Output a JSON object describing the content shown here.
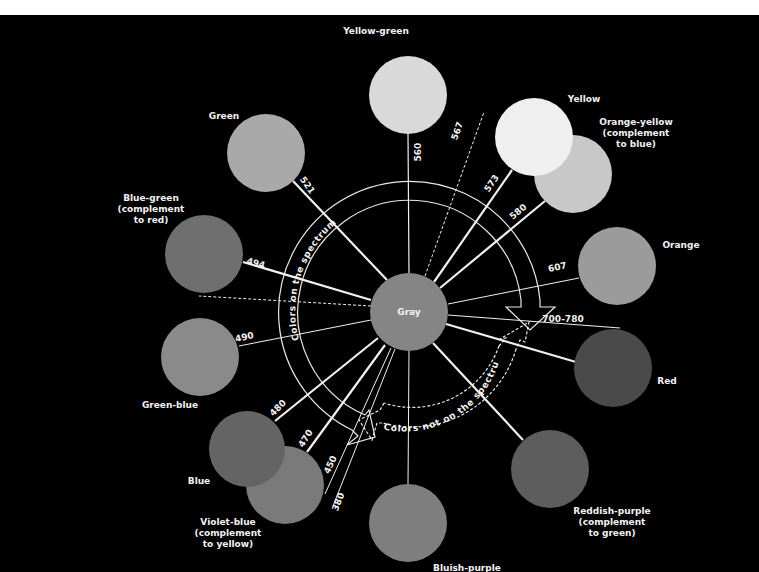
{
  "diagram": {
    "title": "",
    "background": "#000000",
    "line_color": "#f0f0f0",
    "center": {
      "name": "Gray",
      "label": "Gray",
      "x": 409,
      "y": 312,
      "r": 39,
      "color": "#858585"
    },
    "arcs": {
      "on_spectrum_label": "Colors on the spectrum",
      "not_on_spectrum_label": "Colors not on the spectrum"
    },
    "colors": [
      {
        "name": "Yellow-green",
        "label_lines": [
          "Yellow-green"
        ],
        "x": 408,
        "y": 95,
        "r": 39,
        "color": "#d9d9d9",
        "label_x": 376,
        "label_y": 34,
        "anchor": "middle"
      },
      {
        "name": "Yellow",
        "label_lines": [
          "Yellow"
        ],
        "x": 534,
        "y": 137,
        "r": 39,
        "color": "#efefef",
        "label_x": 584,
        "label_y": 102,
        "anchor": "middle"
      },
      {
        "name": "Orange-yellow",
        "label_lines": [
          "Orange-yellow",
          "(complement",
          "to blue)"
        ],
        "x": 573,
        "y": 174,
        "r": 39,
        "color": "#c8c8c8",
        "label_x": 636,
        "label_y": 125,
        "anchor": "middle"
      },
      {
        "name": "Green",
        "label_lines": [
          "Green"
        ],
        "x": 266,
        "y": 153,
        "r": 39,
        "color": "#a9a9a9",
        "label_x": 224,
        "label_y": 119,
        "anchor": "middle"
      },
      {
        "name": "Blue-green",
        "label_lines": [
          "Blue-green",
          "(complement",
          "to red)"
        ],
        "x": 204,
        "y": 254,
        "r": 39,
        "color": "#6f6f6f",
        "label_x": 151,
        "label_y": 201,
        "anchor": "middle"
      },
      {
        "name": "Orange",
        "label_lines": [
          "Orange"
        ],
        "x": 617,
        "y": 266,
        "r": 39,
        "color": "#9b9b9b",
        "label_x": 681,
        "label_y": 248,
        "anchor": "middle"
      },
      {
        "name": "Green-blue",
        "label_lines": [
          "Green-blue"
        ],
        "x": 200,
        "y": 357,
        "r": 39,
        "color": "#8a8a8a",
        "label_x": 170,
        "label_y": 408,
        "anchor": "middle"
      },
      {
        "name": "Red",
        "label_lines": [
          "Red"
        ],
        "x": 613,
        "y": 368,
        "r": 39,
        "color": "#4a4a4a",
        "label_x": 667,
        "label_y": 384,
        "anchor": "middle"
      },
      {
        "name": "Blue",
        "label_lines": [
          "Blue"
        ],
        "x": 247,
        "y": 449,
        "r": 38,
        "color": "#646464",
        "label_x": 199,
        "label_y": 484,
        "anchor": "middle"
      },
      {
        "name": "Violet-blue",
        "label_lines": [
          "Violet-blue",
          "(complement",
          "to yellow)"
        ],
        "x": 285,
        "y": 485,
        "r": 39,
        "color": "#7a7a7a",
        "label_x": 228,
        "label_y": 525,
        "anchor": "middle"
      },
      {
        "name": "Reddish-purple",
        "label_lines": [
          "Reddish-purple",
          "(complement",
          "to green)"
        ],
        "x": 550,
        "y": 469,
        "r": 39,
        "color": "#5d5d5d",
        "label_x": 612,
        "label_y": 514,
        "anchor": "middle"
      },
      {
        "name": "Bluish-purple",
        "label_lines": [
          "Bluish-purple"
        ],
        "x": 408,
        "y": 523,
        "r": 39,
        "color": "#7e7e7e",
        "label_x": 467,
        "label_y": 571,
        "anchor": "middle"
      }
    ],
    "wavelength_lines": [
      {
        "label": "560",
        "x1": 409,
        "y1": 273,
        "x2": 408,
        "y2": 134,
        "width": 1.2,
        "dash": "",
        "lx": 421,
        "ly": 152,
        "rot": -90
      },
      {
        "label": "567",
        "x1": 425,
        "y1": 276,
        "x2": 484,
        "y2": 112,
        "width": 1,
        "dash": "3,2",
        "lx": 460,
        "ly": 132,
        "rot": -70
      },
      {
        "label": "573",
        "x1": 434,
        "y1": 282,
        "x2": 512,
        "y2": 170,
        "width": 2.2,
        "dash": "",
        "lx": 494,
        "ly": 185,
        "rot": -56
      },
      {
        "label": "580",
        "x1": 440,
        "y1": 288,
        "x2": 545,
        "y2": 201,
        "width": 2.2,
        "dash": "",
        "lx": 520,
        "ly": 214,
        "rot": -40
      },
      {
        "label": "607",
        "x1": 448,
        "y1": 304,
        "x2": 579,
        "y2": 278,
        "width": 1,
        "dash": "",
        "lx": 558,
        "ly": 270,
        "rot": -12
      },
      {
        "label": "700-780",
        "x1": 448,
        "y1": 315,
        "x2": 620,
        "y2": 328,
        "width": 1,
        "dash": "",
        "lx": 563,
        "ly": 322,
        "rot": 0
      },
      {
        "label": "",
        "x1": 446,
        "y1": 324,
        "x2": 576,
        "y2": 362,
        "width": 2.2,
        "dash": "",
        "lx": 0,
        "ly": 0,
        "rot": 0
      },
      {
        "label": "521",
        "x1": 387,
        "y1": 280,
        "x2": 293,
        "y2": 181,
        "width": 2.2,
        "dash": "",
        "lx": 305,
        "ly": 187,
        "rot": 55
      },
      {
        "label": "494",
        "x1": 371,
        "y1": 300,
        "x2": 243,
        "y2": 262,
        "width": 2.2,
        "dash": "",
        "lx": 255,
        "ly": 266,
        "rot": 16
      },
      {
        "label": "",
        "x1": 371,
        "y1": 306,
        "x2": 199,
        "y2": 296,
        "width": 1,
        "dash": "3,2",
        "lx": 0,
        "ly": 0,
        "rot": 0
      },
      {
        "label": "490",
        "x1": 371,
        "y1": 320,
        "x2": 239,
        "y2": 346,
        "width": 1,
        "dash": "",
        "lx": 245,
        "ly": 340,
        "rot": -12
      },
      {
        "label": "480",
        "x1": 378,
        "y1": 338,
        "x2": 275,
        "y2": 421,
        "width": 2.2,
        "dash": "",
        "lx": 280,
        "ly": 410,
        "rot": -45
      },
      {
        "label": "470",
        "x1": 385,
        "y1": 345,
        "x2": 307,
        "y2": 452,
        "width": 2.2,
        "dash": "",
        "lx": 308,
        "ly": 440,
        "rot": -58
      },
      {
        "label": "450",
        "x1": 391,
        "y1": 348,
        "x2": 325,
        "y2": 494,
        "width": 1,
        "dash": "",
        "lx": 333,
        "ly": 466,
        "rot": -64
      },
      {
        "label": "380",
        "x1": 395,
        "y1": 349,
        "x2": 333,
        "y2": 506,
        "width": 1,
        "dash": "",
        "lx": 341,
        "ly": 503,
        "rot": -68
      },
      {
        "label": "",
        "x1": 409,
        "y1": 351,
        "x2": 408,
        "y2": 484,
        "width": 1,
        "dash": "",
        "lx": 0,
        "ly": 0,
        "rot": 0
      },
      {
        "label": "",
        "x1": 433,
        "y1": 343,
        "x2": 523,
        "y2": 440,
        "width": 2.2,
        "dash": "",
        "lx": 0,
        "ly": 0,
        "rot": 0
      }
    ]
  }
}
